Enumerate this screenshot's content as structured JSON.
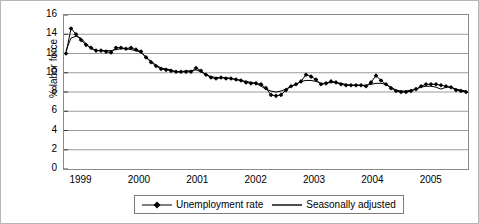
{
  "chart_data": {
    "type": "line",
    "title": "",
    "xlabel": "",
    "ylabel": "% labor force",
    "ylim": [
      0,
      16
    ],
    "ytick_labels": [
      "16",
      "14",
      "12",
      "10",
      "8",
      "6",
      "4",
      "2",
      "0"
    ],
    "ytick_values": [
      16,
      14,
      12,
      10,
      8,
      6,
      4,
      2,
      0
    ],
    "xtick_labels": [
      "1999",
      "2000",
      "2001",
      "2002",
      "2003",
      "2004",
      "2005"
    ],
    "xtick_values": [
      1999,
      2000,
      2001,
      2002,
      2003,
      2004,
      2005
    ],
    "xlim": [
      1999,
      2005.92
    ],
    "grid": "horizontal",
    "legend_position": "bottom-center",
    "series": [
      {
        "name": "Unemployment rate",
        "style": "line-with-diamond-markers",
        "color": "#000000",
        "values": [
          12.0,
          14.6,
          14.0,
          13.4,
          12.9,
          12.6,
          12.3,
          12.3,
          12.2,
          12.1,
          12.6,
          12.6,
          12.5,
          12.6,
          12.4,
          12.2,
          11.6,
          11.1,
          10.7,
          10.4,
          10.3,
          10.2,
          10.1,
          10.1,
          10.1,
          10.1,
          10.5,
          10.2,
          9.8,
          9.5,
          9.4,
          9.5,
          9.4,
          9.4,
          9.3,
          9.2,
          9.0,
          8.9,
          8.9,
          8.8,
          8.4,
          7.7,
          7.6,
          7.7,
          8.2,
          8.6,
          8.8,
          9.1,
          9.8,
          9.6,
          9.3,
          8.8,
          8.9,
          9.1,
          9.0,
          8.8,
          8.7,
          8.7,
          8.7,
          8.7,
          8.6,
          9.0,
          9.7,
          9.2,
          8.8,
          8.4,
          8.1,
          8.0,
          8.0,
          8.1,
          8.3,
          8.6,
          8.8,
          8.8,
          8.8,
          8.7,
          8.6,
          8.5,
          8.2,
          8.1,
          8.0
        ]
      },
      {
        "name": "Seasonally adjusted",
        "style": "plain-line",
        "color": "#000000",
        "values": [
          12.3,
          13.6,
          13.8,
          13.6,
          13.0,
          12.5,
          12.3,
          12.3,
          12.3,
          12.3,
          12.4,
          12.5,
          12.5,
          12.4,
          12.3,
          12.1,
          11.6,
          11.2,
          10.8,
          10.5,
          10.4,
          10.3,
          10.1,
          10.1,
          10.2,
          10.2,
          10.3,
          10.1,
          9.8,
          9.6,
          9.5,
          9.5,
          9.5,
          9.4,
          9.3,
          9.2,
          9.1,
          9.0,
          8.9,
          8.6,
          8.3,
          8.1,
          8.0,
          8.1,
          8.3,
          8.6,
          8.8,
          9.1,
          9.2,
          9.2,
          9.1,
          8.9,
          8.9,
          9.0,
          9.0,
          8.9,
          8.8,
          8.7,
          8.7,
          8.7,
          8.7,
          8.8,
          8.9,
          8.9,
          8.8,
          8.5,
          8.2,
          8.1,
          8.1,
          8.2,
          8.3,
          8.5,
          8.6,
          8.6,
          8.5,
          8.3,
          8.5,
          8.5,
          8.3,
          8.2,
          8.1
        ]
      }
    ]
  },
  "legend": {
    "items": [
      {
        "label": "Unemployment rate",
        "marker": "diamond-marker-icon"
      },
      {
        "label": "Seasonally adjusted",
        "marker": "line-marker-icon"
      }
    ]
  }
}
